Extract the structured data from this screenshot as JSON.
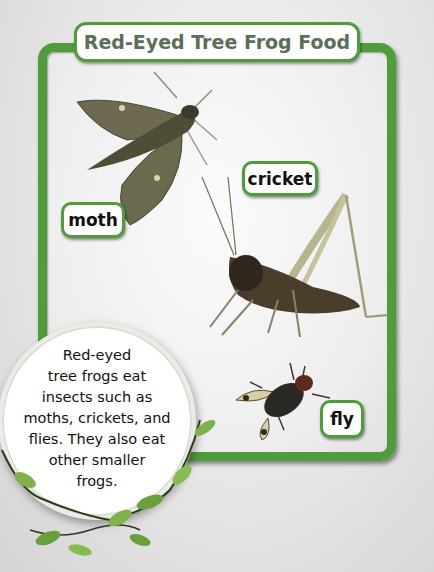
{
  "page": {
    "title": "Red-Eyed Tree Frog Food",
    "colors": {
      "frame": "#4f9c3b",
      "title_text": "#5b6e58",
      "background": "#e6e6e6",
      "label_text": "#111111"
    }
  },
  "labels": {
    "moth": "moth",
    "cricket": "cricket",
    "fly": "fly"
  },
  "images": [
    {
      "name": "moth",
      "icon": "moth-image"
    },
    {
      "name": "cricket",
      "icon": "cricket-image"
    },
    {
      "name": "fly",
      "icon": "fly-image"
    }
  ],
  "callout": {
    "lines": [
      "Red-eyed",
      "tree frogs eat",
      "insects such as",
      "moths, crickets, and",
      "flies. They also eat",
      "other smaller",
      "frogs."
    ]
  }
}
